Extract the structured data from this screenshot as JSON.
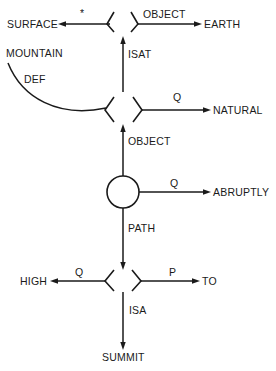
{
  "diagram": {
    "type": "semantic-network",
    "colors": {
      "ink": "#1a1a1a",
      "background": "#ffffff"
    },
    "nodes": {
      "surface": "SURFACE",
      "earth": "EARTH",
      "mountain": "MOUNTAIN",
      "natural": "NATURAL",
      "abruptly": "ABRUPTLY",
      "high": "HIGH",
      "to": "TO",
      "summit": "SUMMIT"
    },
    "edge_labels": {
      "star": "*",
      "object_top": "OBJECT",
      "isat": "ISAT",
      "def": "DEF",
      "q_natural": "Q",
      "object_mid": "OBJECT",
      "q_abruptly": "Q",
      "path": "PATH",
      "q_high": "Q",
      "p_to": "P",
      "isa": "ISA"
    },
    "relations": [
      {
        "from": "top-node",
        "label": "*",
        "to": "SURFACE"
      },
      {
        "from": "top-node",
        "label": "OBJECT",
        "to": "EARTH"
      },
      {
        "from": "middle-node",
        "label": "ISAT",
        "to": "top-node"
      },
      {
        "from": "MOUNTAIN",
        "label": "DEF",
        "to": "middle-node"
      },
      {
        "from": "middle-node",
        "label": "Q",
        "to": "NATURAL"
      },
      {
        "from": "circle-node",
        "label": "OBJECT",
        "to": "middle-node"
      },
      {
        "from": "circle-node",
        "label": "Q",
        "to": "ABRUPTLY"
      },
      {
        "from": "circle-node",
        "label": "PATH",
        "to": "bottom-node"
      },
      {
        "from": "bottom-node",
        "label": "Q",
        "to": "HIGH"
      },
      {
        "from": "bottom-node",
        "label": "P",
        "to": "TO"
      },
      {
        "from": "bottom-node",
        "label": "ISA",
        "to": "SUMMIT"
      }
    ]
  }
}
